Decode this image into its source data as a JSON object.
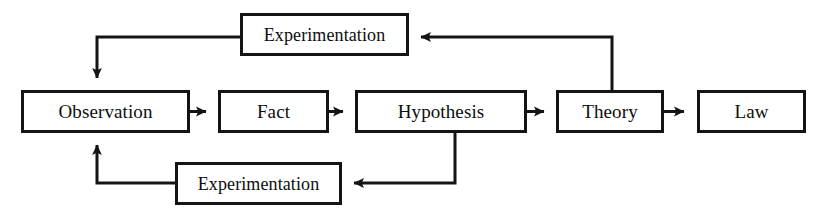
{
  "diagram": {
    "type": "flowchart",
    "background_color": "#ffffff",
    "line_color": "#141414",
    "text_color": "#0d0d0d",
    "nodes": [
      {
        "id": "experimentation_top",
        "label": "Experimentation",
        "x": 240,
        "y": 13,
        "width": 169,
        "height": 43
      },
      {
        "id": "observation",
        "label": "Observation",
        "x": 21,
        "y": 90,
        "width": 169,
        "height": 43
      },
      {
        "id": "fact",
        "label": "Fact",
        "x": 218,
        "y": 90,
        "width": 111,
        "height": 43
      },
      {
        "id": "hypothesis",
        "label": "Hypothesis",
        "x": 355,
        "y": 90,
        "width": 172,
        "height": 43
      },
      {
        "id": "theory",
        "label": "Theory",
        "x": 556,
        "y": 90,
        "width": 108,
        "height": 43
      },
      {
        "id": "law",
        "label": "Law",
        "x": 697,
        "y": 90,
        "width": 109,
        "height": 43
      },
      {
        "id": "experimentation_bottom",
        "label": "Experimentation",
        "x": 175,
        "y": 162,
        "width": 167,
        "height": 43
      }
    ],
    "edges": [
      {
        "id": "observation-to-fact",
        "from": "observation",
        "to": "fact",
        "kind": "straight-right"
      },
      {
        "id": "fact-to-hypothesis",
        "from": "fact",
        "to": "hypothesis",
        "kind": "straight-right"
      },
      {
        "id": "hypothesis-to-theory",
        "from": "hypothesis",
        "to": "theory",
        "kind": "straight-right"
      },
      {
        "id": "theory-to-law",
        "from": "theory",
        "to": "law",
        "kind": "straight-right"
      },
      {
        "id": "theory-to-experimentation-top",
        "from": "theory",
        "to": "experimentation_top",
        "kind": "up-then-left"
      },
      {
        "id": "experimentation-top-to-observation",
        "from": "experimentation_top",
        "to": "observation",
        "kind": "left-then-down"
      },
      {
        "id": "hypothesis-to-experimentation-bottom",
        "from": "hypothesis",
        "to": "experimentation_bottom",
        "kind": "down-then-left"
      },
      {
        "id": "experimentation-bottom-to-observation",
        "from": "experimentation_bottom",
        "to": "observation",
        "kind": "left-then-up"
      }
    ]
  }
}
